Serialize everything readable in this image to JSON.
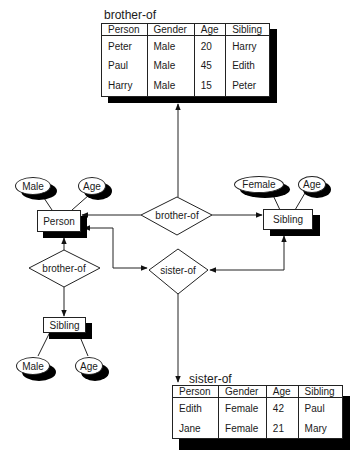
{
  "tables": {
    "brother_of": {
      "title": "brother-of",
      "columns": [
        "Person",
        "Gender",
        "Age",
        "Sibling"
      ],
      "rows": [
        [
          "Peter",
          "Male",
          "20",
          "Harry"
        ],
        [
          "Paul",
          "Male",
          "45",
          "Edith"
        ],
        [
          "Harry",
          "Male",
          "15",
          "Peter"
        ]
      ]
    },
    "sister_of": {
      "title": "sister-of",
      "columns": [
        "Person",
        "Gender",
        "Age",
        "Sibling"
      ],
      "rows": [
        [
          "Edith",
          "Female",
          "42",
          "Paul"
        ],
        [
          "Jane",
          "Female",
          "21",
          "Mary"
        ]
      ]
    }
  },
  "entities": {
    "person": "Person",
    "sibling_right": "Sibling",
    "sibling_bottom": "Sibling"
  },
  "attributes": {
    "person_gender": "Male",
    "person_age": "Age",
    "sibling_right_gender": "Female",
    "sibling_right_age": "Age",
    "sibling_bottom_gender": "Male",
    "sibling_bottom_age": "Age"
  },
  "relationships": {
    "brother_of_center": "brother-of",
    "sister_of_center": "sister-of",
    "brother_of_left": "brother-of"
  }
}
